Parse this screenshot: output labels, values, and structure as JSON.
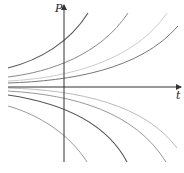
{
  "diagram": {
    "axes": {
      "x_label": "t",
      "y_label": "P",
      "origin_px": [
        64,
        87
      ],
      "x_end_px": 181,
      "y_top_px": 5,
      "y_bottom_px": 162,
      "x_start_px": 8,
      "color": "#333333"
    },
    "curves": [
      {
        "name": "growth-curve-1",
        "path": "M8,68 C40,60 70,42 88,13",
        "color": "#555555",
        "width": 1.1
      },
      {
        "name": "growth-curve-2",
        "path": "M8,77 C50,72 100,55 128,13",
        "color": "#8a8a8a",
        "width": 1
      },
      {
        "name": "growth-curve-3",
        "path": "M8,81 C70,78 135,60 167,13",
        "color": "#cccccc",
        "width": 1
      },
      {
        "name": "growth-curve-4",
        "path": "M8,83 C70,81 140,70 178,26",
        "color": "#777777",
        "width": 1
      },
      {
        "name": "decay-curve-1",
        "path": "M8,88 C80,90 145,105 177,148",
        "color": "#bbbbbb",
        "width": 1
      },
      {
        "name": "decay-curve-2",
        "path": "M8,91 C75,95 135,112 166,162",
        "color": "#999999",
        "width": 1
      },
      {
        "name": "decay-curve-3",
        "path": "M8,95 C55,102 105,120 127,162",
        "color": "#555555",
        "width": 1.1
      },
      {
        "name": "decay-curve-4",
        "path": "M8,106 C40,115 70,135 87,162",
        "color": "#999999",
        "width": 1
      }
    ]
  }
}
